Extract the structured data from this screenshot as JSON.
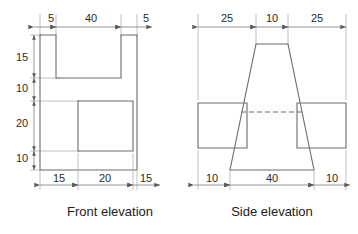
{
  "drawing": {
    "units": "mm",
    "line_color": "#6b6b6b",
    "dimension_color": "#8a8a8a",
    "text_color": "#2b2b2b",
    "background": "#ffffff"
  },
  "views": [
    {
      "id": "front",
      "caption": "Front elevation",
      "caption_x": 110,
      "caption_y": 213,
      "top_dimensions": [
        {
          "label": "5",
          "text_x": 51,
          "text_y": 19
        },
        {
          "label": "40",
          "text_x": 91,
          "text_y": 19
        },
        {
          "label": "5",
          "text_x": 146,
          "text_y": 19
        }
      ],
      "left_dimensions": [
        {
          "label": "15",
          "text_x": 22,
          "text_y": 58
        },
        {
          "label": "10",
          "text_x": 22,
          "text_y": 89
        },
        {
          "label": "20",
          "text_x": 22,
          "text_y": 124
        },
        {
          "label": "10",
          "text_x": 22,
          "text_y": 159
        }
      ],
      "bottom_dimensions": [
        {
          "label": "15",
          "text_x": 59,
          "text_y": 185
        },
        {
          "label": "20",
          "text_x": 96,
          "text_y": 185
        },
        {
          "label": "15",
          "text_x": 141,
          "text_y": 185
        }
      ]
    },
    {
      "id": "side",
      "caption": "Side elevation",
      "caption_x": 272,
      "caption_y": 213,
      "top_dimensions": [
        {
          "label": "25",
          "text_x": 234,
          "text_y": 19
        },
        {
          "label": "10",
          "text_x": 272,
          "text_y": 19
        },
        {
          "label": "25",
          "text_x": 313,
          "text_y": 19
        }
      ],
      "bottom_dimensions": [
        {
          "label": "10",
          "text_x": 212,
          "text_y": 185
        },
        {
          "label": "40",
          "text_x": 272,
          "text_y": 185
        },
        {
          "label": "10",
          "text_x": 332,
          "text_y": 185
        }
      ]
    }
  ],
  "geometry": {
    "front_outline": "M 40,35 L 56,35 L 56,78 L 121,78 L 121,35 L 137,35 L 137,170 L 40,170 Z",
    "front_inner_square": "M 78,101 L 133,101 L 133,151 L 78,151 Z",
    "side_left_rect": "M 198,103 L 247,103 L 247,148 L 198,148 Z",
    "side_right_rect": "M 297,103 L 346,103 L 346,148 L 297,148 Z",
    "side_trapezoid": "M 256,44 L 288,44 L 314,170 L 230,170 Z",
    "side_hidden_line": "M 241,112 L 303,112"
  },
  "labels": {
    "front_caption": "Front elevation",
    "side_caption": "Side elevation"
  }
}
